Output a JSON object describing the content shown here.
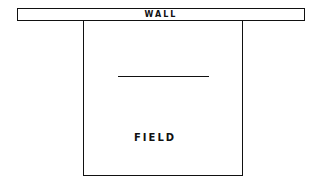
{
  "diagram": {
    "wall": {
      "label": "WALL"
    },
    "field": {
      "label": "FIELD"
    }
  }
}
